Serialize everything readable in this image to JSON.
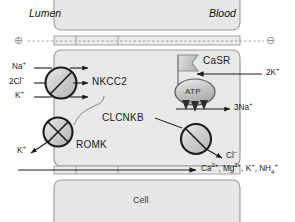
{
  "diagram": {
    "compartments": {
      "lumen": "Lumen",
      "blood": "Blood",
      "cell": "Cell"
    },
    "charges": {
      "lumen_side": "⊕",
      "blood_side": "⊖"
    },
    "proteins": {
      "nkcc2": "NKCC2",
      "romk": "ROMK",
      "clcnkb": "CLCNKB",
      "casr": "CaSR",
      "pump": "ATP"
    },
    "ions": {
      "sodium_in": "Na",
      "sodium_in_charge": "+",
      "chloride_in": "2Cl",
      "chloride_in_charge": "−",
      "potassium_in": "K",
      "potassium_in_charge": "+",
      "potassium_out_romk": "K",
      "potassium_out_romk_charge": "+",
      "potassium_pump": "2K",
      "potassium_pump_charge": "+",
      "sodium_pump": "3Na",
      "sodium_pump_charge": "+",
      "chloride_out": "Cl",
      "chloride_out_charge": "−",
      "paracellular": [
        {
          "name": "Ca",
          "charge": "2+",
          "sep": ", "
        },
        {
          "name": "Mg",
          "charge": "2+",
          "sep": ", "
        },
        {
          "name": "K",
          "charge": "+",
          "sep": ", "
        },
        {
          "name": "NH",
          "sub": "4",
          "charge": "+",
          "sep": ""
        }
      ]
    },
    "colors": {
      "stroke": "#1c1c1c",
      "membrane_fill": "#e6e6e6",
      "membrane_edge": "#9a9a9a",
      "cell_fill": "#e9e9e9",
      "channel_fill": "#d5d5d5",
      "pump_fill": "#cfcfcf",
      "casr_fill": "#c9c9c9",
      "dotted_line": "#9e9e9e",
      "charge_symbol": "#8d8d8d"
    }
  }
}
